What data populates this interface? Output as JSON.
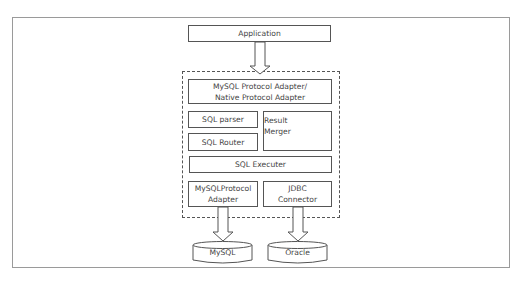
{
  "diagram": {
    "type": "architecture",
    "nodes": {
      "application": "Application",
      "protocol_adapter_line1": "MySQL Protocol Adapter/",
      "protocol_adapter_line2": "Native Protocol Adapter",
      "sql_parser": "SQL parser",
      "sql_router": "SQL Router",
      "result_merger_line1": "Result",
      "result_merger_line2": "Merger",
      "sql_executer": "SQL Executer",
      "mysql_protocol_adapter_line1": "MySQLProtocol",
      "mysql_protocol_adapter_line2": "Adapter",
      "jdbc_connector_line1": "JDBC",
      "jdbc_connector_line2": "Connector",
      "mysql_db": "MySQL",
      "oracle_db": "Oracle"
    },
    "edges": [
      {
        "from": "Application",
        "to": "Proxy (dashed group)"
      },
      {
        "from": "MySQLProtocol Adapter",
        "to": "MySQL"
      },
      {
        "from": "JDBC Connector",
        "to": "Oracle"
      }
    ],
    "colors": {
      "stroke": "#555555",
      "frame": "#9a9a9a",
      "text": "#444444"
    }
  }
}
